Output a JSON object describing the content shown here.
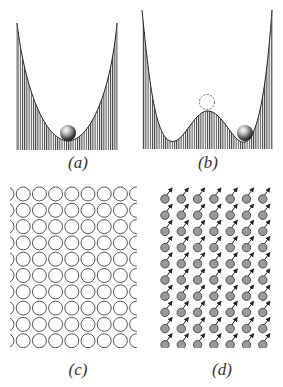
{
  "figure": {
    "panels": [
      {
        "id": "a",
        "label": "(a)",
        "description": "Single potential well with ball at the bottom"
      },
      {
        "id": "b",
        "label": "(b)",
        "description": "Double potential well with ball in right minimum and dashed ball position at the hump top"
      },
      {
        "id": "c",
        "label": "(c)",
        "description": "Lattice of open circles (no magnetic moments)",
        "rows": 10,
        "cols": 9
      },
      {
        "id": "d",
        "label": "(d)",
        "description": "Lattice of grey dots with aligned arrows pointing up-right (ordered moments)",
        "rows": 10,
        "cols": 7
      }
    ],
    "colors": {
      "stroke": "#333333",
      "hatch": "#444444",
      "dot_fill": "#9a9a9a",
      "circle_stroke": "#555555",
      "background": "#ffffff"
    }
  }
}
